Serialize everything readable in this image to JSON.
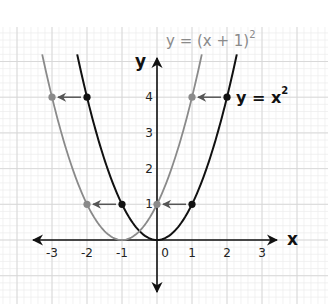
{
  "chart_data": {
    "type": "line",
    "title": "",
    "xlabel": "x",
    "ylabel": "y",
    "xlim": [
      -3.5,
      3.5
    ],
    "ylim": [
      -1.5,
      5.2
    ],
    "grid": true,
    "x_ticks": [
      "-3",
      "-2",
      "-1",
      "0",
      "1",
      "2",
      "3"
    ],
    "y_ticks": [
      "1",
      "2",
      "3",
      "4"
    ],
    "series": [
      {
        "name": "y = x²",
        "label_main": "y = x",
        "label_sup": "2",
        "color": "#111111",
        "function": "x^2",
        "points": [
          [
            -2,
            4
          ],
          [
            -1,
            1
          ],
          [
            1,
            1
          ],
          [
            2,
            4
          ]
        ]
      },
      {
        "name": "y = (x + 1)²",
        "label_main": "y = (x + 1)",
        "label_sup": "2",
        "color": "#8a8a8a",
        "function": "(x+1)^2",
        "points": [
          [
            -3,
            4
          ],
          [
            -2,
            1
          ],
          [
            0,
            1
          ],
          [
            1,
            4
          ]
        ]
      }
    ],
    "annotations": [
      {
        "type": "arrow",
        "from": [
          -2,
          4
        ],
        "to": [
          -3,
          4
        ]
      },
      {
        "type": "arrow",
        "from": [
          -1,
          1
        ],
        "to": [
          -2,
          1
        ]
      },
      {
        "type": "arrow",
        "from": [
          1,
          1
        ],
        "to": [
          0,
          1
        ]
      },
      {
        "type": "arrow",
        "from": [
          2,
          4
        ],
        "to": [
          1,
          4
        ]
      }
    ]
  },
  "colors": {
    "grid_minor": "#ececec",
    "grid_major": "#d6d6d6",
    "axis": "#111111",
    "shifted_curve": "#8a8a8a",
    "base_curve": "#111111"
  }
}
